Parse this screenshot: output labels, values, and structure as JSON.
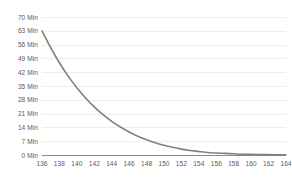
{
  "chart_data": {
    "type": "line",
    "title": "",
    "subtitle": "",
    "xlabel": "",
    "ylabel": "",
    "grid": "horizontal",
    "legend": "none",
    "xlim": [
      136,
      164
    ],
    "ylim": [
      0,
      70
    ],
    "x_tick_labels": [
      "136",
      "138",
      "140",
      "142",
      "144",
      "146",
      "148",
      "150",
      "152",
      "154",
      "156",
      "158",
      "160",
      "162",
      "164"
    ],
    "y_tick_labels": [
      "70 Min",
      "63 Min",
      "56 Min",
      "49 Min",
      "42 Min",
      "35 Min",
      "28 Min",
      "21 Min",
      "14 Min",
      "7 Min",
      "0 Min"
    ],
    "y_tick_values": [
      70,
      63,
      56,
      49,
      42,
      35,
      28,
      21,
      14,
      7,
      0
    ],
    "series": [
      {
        "name": "wait-time",
        "color": "#808080",
        "x": [
          136,
          137,
          138,
          139,
          140,
          141,
          142,
          143,
          144,
          145,
          146,
          147,
          148,
          149,
          150,
          151,
          152,
          153,
          154,
          155,
          156,
          157,
          158,
          159,
          160,
          161,
          162,
          163,
          164
        ],
        "values": [
          63.0,
          54.5,
          46.8,
          40.0,
          34.1,
          28.9,
          24.4,
          20.5,
          17.1,
          14.2,
          11.7,
          9.5,
          7.7,
          6.2,
          4.9,
          3.9,
          3.0,
          2.3,
          1.8,
          1.3,
          1.0,
          0.8,
          0.6,
          0.4,
          0.3,
          0.2,
          0.2,
          0.1,
          0.1
        ]
      }
    ]
  },
  "style": {
    "curve_color": "#808080",
    "gridline_color": "#ededed",
    "axis_color": "#8a8a8a",
    "label_color": "#595959",
    "background": "#ffffff"
  }
}
